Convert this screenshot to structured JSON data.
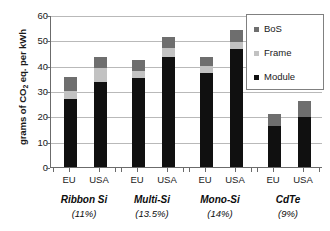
{
  "chart_data": {
    "type": "bar",
    "subtype": "stacked-bar-grouped",
    "title": "",
    "xlabel": "",
    "ylabel": "grams of CO2 eq. per kWh",
    "ylabel_parts": {
      "pre": "grams of CO",
      "sub": "2",
      "post": " eq. per kWh"
    },
    "ylim": [
      0,
      60
    ],
    "yticks": [
      0,
      10,
      20,
      30,
      40,
      50,
      60
    ],
    "ytick_labels": [
      "0",
      "10",
      "20",
      "30",
      "40",
      "50",
      "60"
    ],
    "grid": true,
    "grid_axis": "y",
    "legend_position": "top-right",
    "categories": [
      "Ribbon Si EU",
      "Ribbon Si USA",
      "Multi-Si EU",
      "Multi-Si USA",
      "Mono-Si EU",
      "Mono-Si USA",
      "CdTe EU",
      "CdTe USA"
    ],
    "x": [
      "EU",
      "USA",
      "EU",
      "USA",
      "EU",
      "USA",
      "EU",
      "USA"
    ],
    "groups": [
      {
        "name": "Ribbon Si",
        "efficiency": "(11%)"
      },
      {
        "name": "Multi-Si",
        "efficiency": "(13.5%)"
      },
      {
        "name": "Mono-Si",
        "efficiency": "(14%)"
      },
      {
        "name": "CdTe",
        "efficiency": "(9%)"
      }
    ],
    "series": [
      {
        "name": "Module",
        "color": "#101010",
        "values": [
          26.8,
          33.7,
          35.0,
          43.4,
          37.2,
          46.4,
          16.0,
          19.6
        ]
      },
      {
        "name": "Frame",
        "color": "#c2c2c2",
        "values": [
          3.2,
          5.5,
          3.0,
          3.4,
          2.7,
          3.1,
          0.0,
          0.0
        ]
      },
      {
        "name": "BoS",
        "color": "#6e6e6e",
        "values": [
          5.5,
          4.1,
          4.2,
          4.7,
          3.6,
          4.5,
          4.9,
          6.3
        ]
      }
    ],
    "totals": [
      35.5,
      43.3,
      42.2,
      51.5,
      43.5,
      54.0,
      20.9,
      25.9
    ],
    "legend": [
      {
        "label": "BoS",
        "color": "#6e6e6e"
      },
      {
        "label": "Frame",
        "color": "#c2c2c2"
      },
      {
        "label": "Module",
        "color": "#101010"
      }
    ]
  },
  "colors": {
    "module": "#101010",
    "frame": "#c2c2c2",
    "bos": "#6e6e6e",
    "grid": "#b9b9b9",
    "axis": "#6b6b6b",
    "text": "#1a1a1a",
    "background": "#ffffff"
  }
}
